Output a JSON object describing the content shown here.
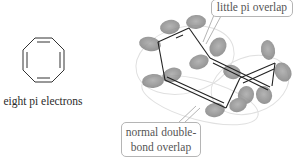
{
  "left_molecule": {
    "name": "cyclooctatetraene planar",
    "caption": "eight pi electrons"
  },
  "right_molecule": {
    "name": "cyclooctatetraene tub conformation",
    "callouts": {
      "top": "little pi overlap",
      "bottom_line1": "normal double-",
      "bottom_line2": "bond overlap"
    }
  },
  "colors": {
    "bond": "#222222",
    "orbital_lobe": "#8a8a8a",
    "callout_border": "#b5b5b5",
    "callout_text": "#555555",
    "guide_ellipse": "#dddddd"
  }
}
